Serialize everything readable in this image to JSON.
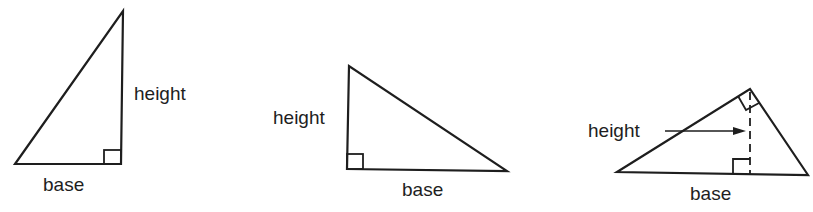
{
  "figure": {
    "stroke_color": "#1e1e1e",
    "triangles": [
      {
        "id": 1,
        "height_label": "height",
        "base_label": "base"
      },
      {
        "id": 2,
        "height_label": "height",
        "base_label": "base"
      },
      {
        "id": 3,
        "height_label": "height",
        "base_label": "base"
      }
    ]
  }
}
